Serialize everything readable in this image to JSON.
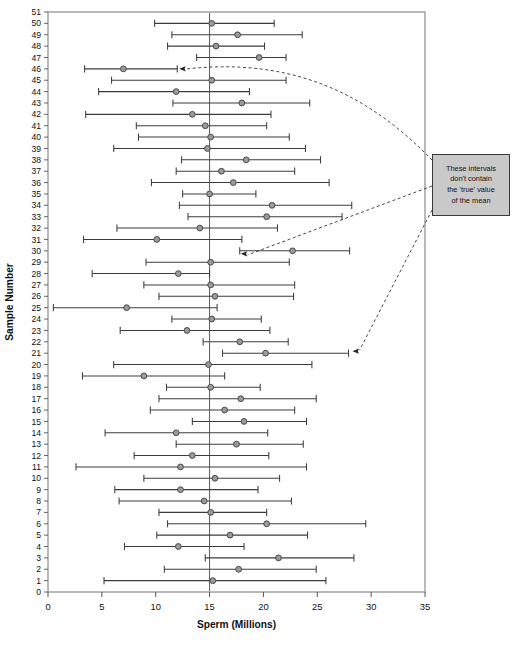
{
  "figure": {
    "background": "#ffffff",
    "frame_color": "#808080",
    "marker_fill": "#9a9a9a",
    "marker_stroke": "#4a4a4a",
    "interval_color": "#3c3c3c",
    "reference_line_color": "#5a5a5a",
    "annotation_fill": "#c9c9c9",
    "annotation_border": "#3a3a3a"
  },
  "annotation": {
    "name": "callout-these-intervals",
    "lines": [
      "These intervals",
      "don't contain",
      "the 'true' value",
      "of the mean"
    ],
    "points_to_samples": [
      46,
      30,
      21
    ]
  },
  "chart_data": {
    "type": "scatter",
    "subtype": "confidence-interval-plot",
    "title": "",
    "xlabel": "Sperm (Millions)",
    "ylabel": "Sample Number",
    "xlim": [
      0,
      35
    ],
    "ylim": [
      0,
      51
    ],
    "xticks": [
      0,
      5,
      10,
      15,
      20,
      25,
      30,
      35
    ],
    "xtick_labels": [
      "0",
      "5",
      "10",
      "15",
      "20",
      "25",
      "30",
      "35"
    ],
    "yticks": [
      0,
      1,
      2,
      3,
      4,
      5,
      6,
      7,
      8,
      9,
      10,
      11,
      12,
      13,
      14,
      15,
      16,
      17,
      18,
      19,
      20,
      21,
      22,
      23,
      24,
      25,
      26,
      27,
      28,
      29,
      30,
      31,
      32,
      33,
      34,
      35,
      36,
      37,
      38,
      39,
      40,
      41,
      42,
      43,
      44,
      45,
      46,
      47,
      48,
      49,
      50,
      51
    ],
    "ytick_labels": [
      "0",
      "1",
      "2",
      "3",
      "4",
      "5",
      "6",
      "7",
      "8",
      "9",
      "10",
      "11",
      "12",
      "13",
      "14",
      "15",
      "16",
      "17",
      "18",
      "19",
      "20",
      "21",
      "22",
      "23",
      "24",
      "25",
      "26",
      "27",
      "28",
      "29",
      "30",
      "31",
      "32",
      "33",
      "34",
      "35",
      "36",
      "37",
      "38",
      "39",
      "40",
      "41",
      "42",
      "43",
      "44",
      "45",
      "46",
      "47",
      "48",
      "49",
      "50",
      "51"
    ],
    "grid": false,
    "legend": null,
    "reference_line": {
      "orientation": "vertical",
      "value": 15.0,
      "label": "true mean"
    },
    "series_name": "sample mean with 95% confidence interval",
    "intervals": [
      {
        "sample": 50,
        "mean": 15.2,
        "low": 9.9,
        "high": 21.0,
        "contains_true": true
      },
      {
        "sample": 49,
        "mean": 17.6,
        "low": 11.5,
        "high": 23.6,
        "contains_true": true
      },
      {
        "sample": 48,
        "mean": 15.6,
        "low": 11.1,
        "high": 20.1,
        "contains_true": true
      },
      {
        "sample": 47,
        "mean": 19.6,
        "low": 13.8,
        "high": 22.1,
        "contains_true": true
      },
      {
        "sample": 46,
        "mean": 7.0,
        "low": 3.4,
        "high": 12.0,
        "contains_true": false
      },
      {
        "sample": 45,
        "mean": 15.2,
        "low": 5.9,
        "high": 22.1,
        "contains_true": true
      },
      {
        "sample": 44,
        "mean": 11.9,
        "low": 4.7,
        "high": 18.7,
        "contains_true": true
      },
      {
        "sample": 43,
        "mean": 18.0,
        "low": 11.6,
        "high": 24.3,
        "contains_true": true
      },
      {
        "sample": 42,
        "mean": 13.4,
        "low": 3.5,
        "high": 20.7,
        "contains_true": true
      },
      {
        "sample": 41,
        "mean": 14.6,
        "low": 8.2,
        "high": 20.3,
        "contains_true": true
      },
      {
        "sample": 40,
        "mean": 15.1,
        "low": 8.4,
        "high": 22.4,
        "contains_true": true
      },
      {
        "sample": 39,
        "mean": 14.8,
        "low": 6.1,
        "high": 23.9,
        "contains_true": true
      },
      {
        "sample": 38,
        "mean": 18.4,
        "low": 12.4,
        "high": 25.3,
        "contains_true": true
      },
      {
        "sample": 37,
        "mean": 16.1,
        "low": 11.9,
        "high": 22.9,
        "contains_true": true
      },
      {
        "sample": 36,
        "mean": 17.2,
        "low": 9.6,
        "high": 26.1,
        "contains_true": true
      },
      {
        "sample": 35,
        "mean": 15.0,
        "low": 12.5,
        "high": 19.3,
        "contains_true": true
      },
      {
        "sample": 34,
        "mean": 20.8,
        "low": 12.2,
        "high": 28.2,
        "contains_true": true
      },
      {
        "sample": 33,
        "mean": 20.3,
        "low": 13.0,
        "high": 27.3,
        "contains_true": true
      },
      {
        "sample": 32,
        "mean": 14.1,
        "low": 6.4,
        "high": 21.3,
        "contains_true": true
      },
      {
        "sample": 31,
        "mean": 10.1,
        "low": 3.3,
        "high": 18.0,
        "contains_true": true
      },
      {
        "sample": 30,
        "mean": 22.7,
        "low": 17.8,
        "high": 28.0,
        "contains_true": false
      },
      {
        "sample": 29,
        "mean": 15.1,
        "low": 9.1,
        "high": 22.4,
        "contains_true": true
      },
      {
        "sample": 28,
        "mean": 12.1,
        "low": 4.1,
        "high": 15.0,
        "contains_true": true
      },
      {
        "sample": 27,
        "mean": 15.1,
        "low": 8.9,
        "high": 22.9,
        "contains_true": true
      },
      {
        "sample": 26,
        "mean": 15.5,
        "low": 10.3,
        "high": 22.8,
        "contains_true": true
      },
      {
        "sample": 25,
        "mean": 7.3,
        "low": 0.5,
        "high": 15.7,
        "contains_true": true
      },
      {
        "sample": 24,
        "mean": 15.2,
        "low": 11.5,
        "high": 19.8,
        "contains_true": true
      },
      {
        "sample": 23,
        "mean": 12.9,
        "low": 6.7,
        "high": 20.6,
        "contains_true": true
      },
      {
        "sample": 22,
        "mean": 17.8,
        "low": 14.4,
        "high": 22.3,
        "contains_true": true
      },
      {
        "sample": 21,
        "mean": 20.2,
        "low": 16.2,
        "high": 27.9,
        "contains_true": false
      },
      {
        "sample": 20,
        "mean": 14.9,
        "low": 6.1,
        "high": 24.5,
        "contains_true": true
      },
      {
        "sample": 19,
        "mean": 8.9,
        "low": 3.2,
        "high": 16.4,
        "contains_true": true
      },
      {
        "sample": 18,
        "mean": 15.1,
        "low": 11.0,
        "high": 19.7,
        "contains_true": true
      },
      {
        "sample": 17,
        "mean": 17.9,
        "low": 10.3,
        "high": 24.9,
        "contains_true": true
      },
      {
        "sample": 16,
        "mean": 16.4,
        "low": 9.5,
        "high": 22.9,
        "contains_true": true
      },
      {
        "sample": 15,
        "mean": 18.2,
        "low": 13.4,
        "high": 24.0,
        "contains_true": true
      },
      {
        "sample": 14,
        "mean": 11.9,
        "low": 5.3,
        "high": 20.4,
        "contains_true": true
      },
      {
        "sample": 13,
        "mean": 17.5,
        "low": 11.9,
        "high": 23.7,
        "contains_true": true
      },
      {
        "sample": 12,
        "mean": 13.4,
        "low": 8.0,
        "high": 20.5,
        "contains_true": true
      },
      {
        "sample": 11,
        "mean": 12.3,
        "low": 2.6,
        "high": 24.0,
        "contains_true": true
      },
      {
        "sample": 10,
        "mean": 15.5,
        "low": 8.9,
        "high": 21.5,
        "contains_true": true
      },
      {
        "sample": 9,
        "mean": 12.3,
        "low": 6.2,
        "high": 19.5,
        "contains_true": true
      },
      {
        "sample": 8,
        "mean": 14.5,
        "low": 6.6,
        "high": 22.6,
        "contains_true": true
      },
      {
        "sample": 7,
        "mean": 15.1,
        "low": 10.3,
        "high": 20.3,
        "contains_true": true
      },
      {
        "sample": 6,
        "mean": 20.3,
        "low": 11.1,
        "high": 29.5,
        "contains_true": true
      },
      {
        "sample": 5,
        "mean": 16.9,
        "low": 10.1,
        "high": 24.1,
        "contains_true": true
      },
      {
        "sample": 4,
        "mean": 12.1,
        "low": 7.1,
        "high": 18.2,
        "contains_true": true
      },
      {
        "sample": 3,
        "mean": 21.4,
        "low": 14.6,
        "high": 28.4,
        "contains_true": true
      },
      {
        "sample": 2,
        "mean": 17.7,
        "low": 10.8,
        "high": 24.9,
        "contains_true": true
      },
      {
        "sample": 1,
        "mean": 15.3,
        "low": 5.2,
        "high": 25.8,
        "contains_true": true
      }
    ]
  }
}
